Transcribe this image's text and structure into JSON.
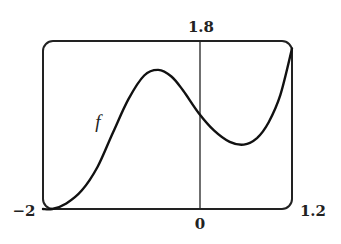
{
  "chart_data": {
    "type": "line",
    "title": "",
    "xlabel": "",
    "ylabel": "",
    "xlim": [
      -2,
      1.2
    ],
    "ylim": [
      0,
      1.8
    ],
    "grid": false,
    "legend": null,
    "tick_labels": {
      "x_min": "−2",
      "x_max": "1.2",
      "origin": "0",
      "y_max": "1.8"
    },
    "annotations": [
      {
        "text": "f",
        "x": -1.29,
        "y": 0.92
      }
    ],
    "series": [
      {
        "name": "f",
        "x": [
          -2.0,
          -1.88,
          -1.7,
          -1.5,
          -1.3,
          -1.1,
          -0.9,
          -0.7,
          -0.52,
          -0.35,
          -0.2,
          0.0,
          0.2,
          0.4,
          0.58,
          0.75,
          0.9,
          1.05,
          1.2
        ],
        "y": [
          0.0,
          0.0,
          0.06,
          0.2,
          0.45,
          0.82,
          1.18,
          1.43,
          1.49,
          1.42,
          1.27,
          1.03,
          0.84,
          0.72,
          0.69,
          0.76,
          0.93,
          1.22,
          1.72
        ]
      }
    ],
    "features": {
      "local_max": {
        "x": -0.52,
        "y": 1.49
      },
      "local_min": {
        "x": 0.58,
        "y": 0.69
      },
      "y_intercept": {
        "x": 0,
        "y": 1.03
      }
    }
  },
  "labels": {
    "x_min": "−2",
    "x_max": "1.2",
    "origin": "0",
    "y_max": "1.8",
    "curve": "f"
  }
}
